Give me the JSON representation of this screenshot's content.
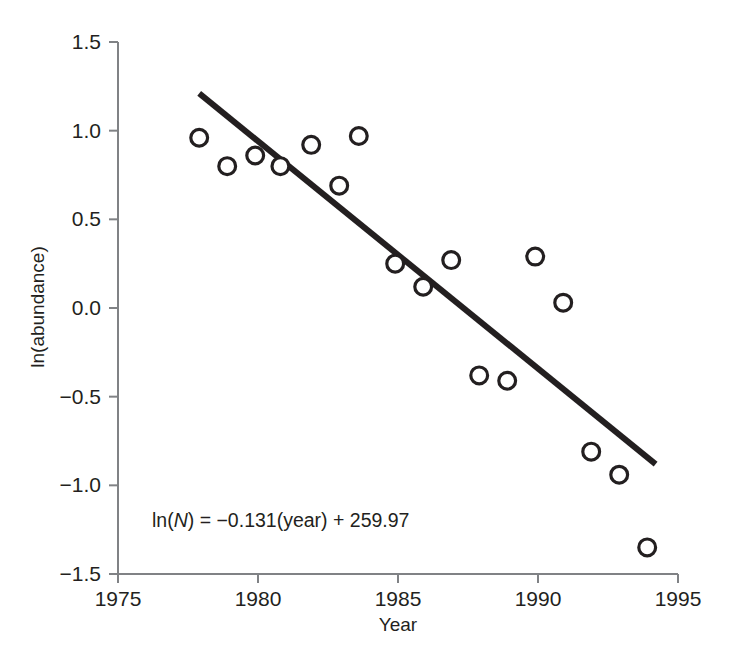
{
  "chart_data": {
    "type": "scatter",
    "title": "",
    "xlabel": "Year",
    "ylabel": "ln(abundance)",
    "xlim": [
      1975,
      1995
    ],
    "ylim": [
      -1.5,
      1.5
    ],
    "xticks": [
      1975,
      1980,
      1985,
      1990,
      1995
    ],
    "xtick_labels": [
      "1975",
      "1980",
      "1985",
      "1990",
      "1995"
    ],
    "yticks": [
      1.5,
      1.0,
      0.5,
      0.0,
      -0.5,
      -1.0,
      -1.5
    ],
    "ytick_labels": [
      "1.5",
      "1.0",
      "0.5",
      "0.0",
      "−0.5",
      "−1.0",
      "−1.5"
    ],
    "grid": false,
    "legend": null,
    "marker_style": "open-circle",
    "series": [
      {
        "name": "ln(abundance) observations",
        "points": [
          {
            "x": 1977.9,
            "y": 0.96
          },
          {
            "x": 1978.9,
            "y": 0.8
          },
          {
            "x": 1979.9,
            "y": 0.86
          },
          {
            "x": 1980.8,
            "y": 0.8
          },
          {
            "x": 1981.9,
            "y": 0.92
          },
          {
            "x": 1982.9,
            "y": 0.69
          },
          {
            "x": 1983.6,
            "y": 0.97
          },
          {
            "x": 1984.9,
            "y": 0.25
          },
          {
            "x": 1985.9,
            "y": 0.12
          },
          {
            "x": 1986.9,
            "y": 0.27
          },
          {
            "x": 1987.9,
            "y": -0.38
          },
          {
            "x": 1988.9,
            "y": -0.41
          },
          {
            "x": 1989.9,
            "y": 0.29
          },
          {
            "x": 1990.9,
            "y": 0.03
          },
          {
            "x": 1991.9,
            "y": -0.81
          },
          {
            "x": 1992.9,
            "y": -0.94
          },
          {
            "x": 1993.9,
            "y": -1.35
          }
        ]
      }
    ],
    "trend_line": {
      "equation": "ln(N) = −0.131(year) + 259.97",
      "slope": -0.131,
      "intercept": 259.97,
      "x_start": 1977.9,
      "y_start": 1.21,
      "x_end": 1994.2,
      "y_end": -0.88
    },
    "annotation": {
      "prefix": "ln(",
      "italic_symbol": "N",
      "suffix": ") = −0.131(year) + 259.97"
    },
    "colors": {
      "marker_stroke": "#231f20",
      "marker_fill": "#ffffff",
      "trend_line": "#231f20",
      "axis": "#808285",
      "text": "#231f20",
      "background": "#ffffff"
    }
  }
}
